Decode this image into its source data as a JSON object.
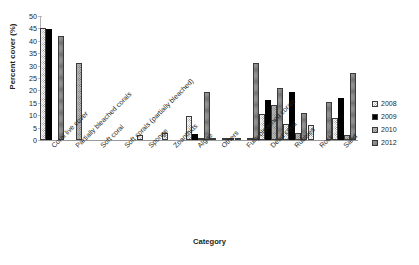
{
  "chart_data": {
    "type": "bar",
    "title": "",
    "xlabel": "Category",
    "ylabel": "Percent cover (%)",
    "ylim": [
      0,
      50
    ],
    "ytick_step": 5,
    "yticks": [
      "0",
      "5",
      "10",
      "15",
      "20",
      "25",
      "30",
      "35",
      "40",
      "45",
      "50"
    ],
    "grid": false,
    "legend_position": "right",
    "categories": [
      "Coral live cover",
      "Partially bleached corals",
      "Soft coral",
      "Soft corals (partially bleached)",
      "Sponge",
      "Zoanthids",
      "Algae",
      "Others",
      "Fully bleached corals",
      "Dead coral",
      "Rubbles",
      "Rock",
      "Sand"
    ],
    "series": [
      {
        "name": "2008",
        "values": [
          45.2,
          0,
          0,
          0,
          2.2,
          2.8,
          9.5,
          0.5,
          0.6,
          10.4,
          6.3,
          6.0,
          9.0
        ]
      },
      {
        "name": "2009",
        "values": [
          44.8,
          0,
          0,
          0,
          0,
          0,
          2.3,
          0,
          0,
          16.0,
          19.2,
          0,
          17.0
        ]
      },
      {
        "name": "2010",
        "values": [
          0,
          31.0,
          0,
          0,
          0,
          0,
          1.0,
          0.6,
          0.4,
          14.0,
          3.0,
          0,
          2.0
        ]
      },
      {
        "name": "2012",
        "values": [
          41.8,
          0,
          0,
          0,
          0,
          0,
          19.2,
          0.8,
          31.0,
          21.0,
          11.0,
          15.5,
          27.0
        ]
      }
    ]
  },
  "legend": {
    "items": [
      {
        "label": "2008"
      },
      {
        "label": "2009"
      },
      {
        "label": "2010"
      },
      {
        "label": "2012"
      }
    ]
  }
}
